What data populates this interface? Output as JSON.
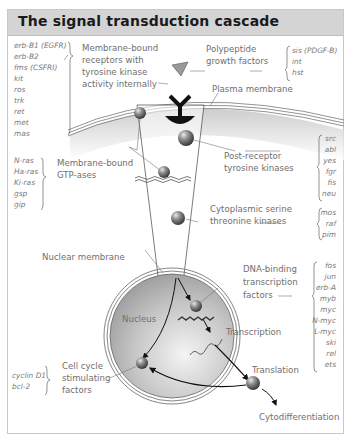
{
  "title": "The signal transduction cascade",
  "labels": {
    "receptors": [
      "Membrane-bound",
      "receptors with",
      "tyrosine kinase",
      "activity internally"
    ],
    "growth_factors": [
      "Polypeptide",
      "growth factors"
    ],
    "plasma_membrane": "Plasma membrane",
    "gtpases": [
      "Membrane-bound",
      "GTP-ases"
    ],
    "post_receptor": [
      "Post-receptor",
      "tyrosine kinases"
    ],
    "cytoplasmic": [
      "Cytoplasmic serine",
      "threonine kinases"
    ],
    "nuclear_membrane": "Nuclear membrane",
    "nucleus": "Nucleus",
    "dna_binding": [
      "DNA-binding",
      "transcription",
      "factors"
    ],
    "transcription": "Transcription",
    "translation": "Translation",
    "cell_cycle": [
      "Cell cycle",
      "stimulating",
      "factors"
    ],
    "cytodifferentiation": "Cytodifferentiation"
  },
  "genes": {
    "receptor_genes": [
      "erb-B1 (EGFR)",
      "erb-B2",
      "fms (CSFRI)",
      "kit",
      "ros",
      "trk",
      "ret",
      "met",
      "mas"
    ],
    "growth_factor_genes": [
      "sis (PDGF-B)",
      "int",
      "hst"
    ],
    "gtpase_genes": [
      "N-ras",
      "Ha-ras",
      "Ki-ras",
      "gsp",
      "gip"
    ],
    "post_receptor_genes": [
      "src",
      "abl",
      "yes",
      "fgr",
      "fis",
      "neu"
    ],
    "cytoplasmic_genes": [
      "mos",
      "raf",
      "pim"
    ],
    "transcription_genes": [
      "fos",
      "jun",
      "erb-A",
      "myb",
      "myc",
      "N-myc",
      "L-myc",
      "ski",
      "rel",
      "ets"
    ],
    "cell_cycle_genes": [
      "cyclin D1",
      "bcl-2"
    ]
  },
  "colors": {
    "header_bg": "#d4d4d4",
    "label_text": "#6f6f6f",
    "nucleus_fill": "#bdbdbd",
    "sphere": "#707070"
  }
}
